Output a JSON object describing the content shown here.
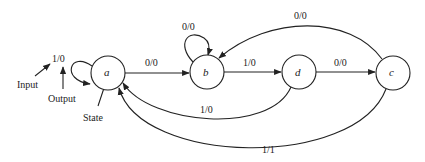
{
  "diagram": {
    "type": "finite-state-machine",
    "legend": {
      "input_label": "Input",
      "output_label": "Output",
      "state_label": "State",
      "example_transition": "1/0"
    },
    "states": [
      {
        "id": "a",
        "label": "a"
      },
      {
        "id": "b",
        "label": "b"
      },
      {
        "id": "d",
        "label": "d"
      },
      {
        "id": "c",
        "label": "c"
      }
    ],
    "transitions": [
      {
        "from": "a",
        "to": "a",
        "label": "1/0"
      },
      {
        "from": "a",
        "to": "b",
        "label": "0/0"
      },
      {
        "from": "b",
        "to": "b",
        "label": "0/0"
      },
      {
        "from": "b",
        "to": "d",
        "label": "1/0"
      },
      {
        "from": "d",
        "to": "c",
        "label": "0/0"
      },
      {
        "from": "c",
        "to": "b",
        "label": "0/0"
      },
      {
        "from": "d",
        "to": "a",
        "label": "1/0"
      },
      {
        "from": "c",
        "to": "a",
        "label": "1/1"
      }
    ]
  }
}
